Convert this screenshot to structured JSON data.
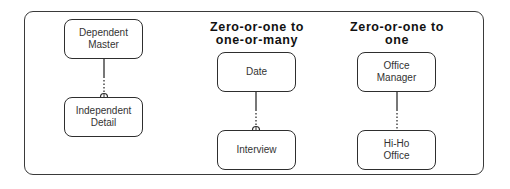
{
  "diagram": {
    "type": "entity-relationship",
    "groups": [
      {
        "heading": "",
        "parent": {
          "label": "Dependent\nMaster"
        },
        "child": {
          "label": "Independent\nDetail"
        },
        "relationship": {
          "style": "solid-to-dotted",
          "child_end_marker": "zero-or-one (small semicircle/diamond)"
        }
      },
      {
        "heading": "Zero-or-one  to\none-or-many",
        "parent": {
          "label": "Date"
        },
        "child": {
          "label": "Interview"
        },
        "relationship": {
          "style": "solid-to-dotted",
          "child_end_marker": "zero-or-one (small semicircle)"
        }
      },
      {
        "heading": "Zero-or-one  to\none",
        "parent": {
          "label": "Office\nManager"
        },
        "child": {
          "label": "Hi-Ho\nOffice"
        },
        "relationship": {
          "style": "solid-to-dotted",
          "child_end_marker": "none"
        }
      }
    ]
  },
  "colors": {
    "line": "#2e2e2e",
    "background": "#ffffff",
    "text": "#333333"
  }
}
